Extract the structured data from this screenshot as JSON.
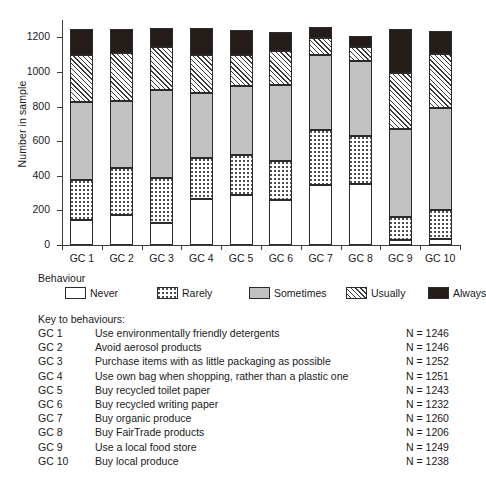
{
  "chart_data": {
    "type": "bar",
    "subtype": "stacked-vertical",
    "title": "",
    "xlabel": "",
    "ylabel": "Number in sample",
    "ylim": [
      0,
      1300
    ],
    "yticks": [
      0,
      200,
      400,
      600,
      800,
      1000,
      1200
    ],
    "grid": false,
    "legend_position": "below-axes",
    "legend_title": "Behaviour",
    "categories": [
      "GC 1",
      "GC 2",
      "GC 3",
      "GC 4",
      "GC 5",
      "GC 6",
      "GC 7",
      "GC 8",
      "GC 9",
      "GC 10"
    ],
    "series": [
      {
        "name": "Never",
        "fill": "white",
        "values": [
          145,
          175,
          128,
          265,
          290,
          260,
          345,
          350,
          30,
          33
        ]
      },
      {
        "name": "Rarely",
        "fill": "dotted",
        "values": [
          230,
          268,
          257,
          238,
          230,
          225,
          320,
          278,
          132,
          169
        ]
      },
      {
        "name": "Sometimes",
        "fill": "light-gray",
        "values": [
          450,
          390,
          512,
          374,
          400,
          440,
          430,
          437,
          511,
          588
        ]
      },
      {
        "name": "Usually",
        "fill": "hatched",
        "values": [
          275,
          277,
          246,
          223,
          180,
          197,
          103,
          80,
          322,
          313
        ]
      },
      {
        "name": "Always",
        "fill": "black",
        "values": [
          146,
          136,
          109,
          151,
          143,
          110,
          62,
          61,
          254,
          135
        ]
      }
    ],
    "cumulative_tops": {
      "GC 1": [
        145,
        375,
        825,
        1100,
        1246
      ],
      "GC 2": [
        175,
        443,
        833,
        1110,
        1246
      ],
      "GC 3": [
        128,
        385,
        897,
        1143,
        1252
      ],
      "GC 4": [
        265,
        503,
        877,
        1100,
        1251
      ],
      "GC 5": [
        290,
        520,
        920,
        1100,
        1243
      ],
      "GC 6": [
        260,
        485,
        925,
        1122,
        1232
      ],
      "GC 7": [
        345,
        665,
        1095,
        1198,
        1260
      ],
      "GC 8": [
        350,
        628,
        1065,
        1145,
        1206
      ],
      "GC 9": [
        30,
        162,
        673,
        995,
        1249
      ],
      "GC 10": [
        33,
        202,
        790,
        1103,
        1238
      ]
    },
    "totals": [
      1246,
      1246,
      1252,
      1251,
      1243,
      1232,
      1260,
      1206,
      1249,
      1238
    ]
  },
  "axis": {
    "y_title": "Number in sample",
    "y_tick_labels": [
      "0",
      "200",
      "400",
      "600",
      "800",
      "1000",
      "1200"
    ],
    "x_tick_labels": [
      "GC 1",
      "GC 2",
      "GC 3",
      "GC 4",
      "GC 5",
      "GC 6",
      "GC 7",
      "GC 8",
      "GC 9",
      "GC 10"
    ]
  },
  "legend": {
    "title": "Behaviour",
    "items": [
      {
        "label": "Never"
      },
      {
        "label": "Rarely"
      },
      {
        "label": "Sometimes"
      },
      {
        "label": "Usually"
      },
      {
        "label": "Always"
      }
    ]
  },
  "key": {
    "title": "Key to behaviours:",
    "rows": [
      {
        "code": "GC 1",
        "description": "Use environmentally friendly detergents",
        "n": "N = 1246"
      },
      {
        "code": "GC 2",
        "description": "Avoid aerosol products",
        "n": "N = 1246"
      },
      {
        "code": "GC 3",
        "description": "Purchase items with as little packaging as possible",
        "n": "N = 1252"
      },
      {
        "code": "GC 4",
        "description": "Use own bag when shopping, rather than a plastic one",
        "n": "N = 1251"
      },
      {
        "code": "GC 5",
        "description": "Buy recycled toilet paper",
        "n": "N = 1243"
      },
      {
        "code": "GC 6",
        "description": "Buy recycled writing paper",
        "n": "N = 1232"
      },
      {
        "code": "GC 7",
        "description": "Buy organic produce",
        "n": "N = 1260"
      },
      {
        "code": "GC 8",
        "description": "Buy FairTrade products",
        "n": "N = 1206"
      },
      {
        "code": "GC 9",
        "description": "Use a local food store",
        "n": "N = 1249"
      },
      {
        "code": "GC 10",
        "description": "Buy local produce",
        "n": "N = 1238"
      }
    ]
  },
  "colors": {
    "never": "#ffffff",
    "rarely": "#ffffff",
    "sometimes": "#c2c2c2",
    "usually": "#ffffff",
    "always": "#231c19",
    "outline": "#2b2b2b",
    "axis": "#3b3b3b",
    "text": "#1a1a1a"
  }
}
